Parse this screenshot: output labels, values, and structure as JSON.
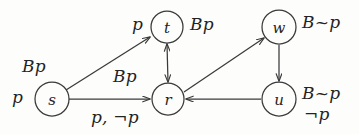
{
  "figure": {
    "type": "kripke-model-diagram",
    "ink_color": "#3a3a3a",
    "background_color": "#fdfdfc"
  },
  "nodes": [
    {
      "id": "s",
      "label": "s",
      "cx": 52,
      "cy": 99,
      "r": 17
    },
    {
      "id": "t",
      "label": "t",
      "cx": 167,
      "cy": 27,
      "r": 16
    },
    {
      "id": "r",
      "label": "r",
      "cx": 168,
      "cy": 99,
      "r": 16
    },
    {
      "id": "w",
      "label": "w",
      "cx": 279,
      "cy": 27,
      "r": 17
    },
    {
      "id": "u",
      "label": "u",
      "cx": 279,
      "cy": 99,
      "r": 17
    }
  ],
  "annotations": [
    {
      "for": "s",
      "text": "Bp",
      "position": "above-left",
      "x": 22,
      "y": 56
    },
    {
      "for": "s",
      "text": "p",
      "position": "left",
      "x": 12,
      "y": 87
    },
    {
      "for": "t",
      "text": "p",
      "position": "left",
      "x": 132,
      "y": 14
    },
    {
      "for": "t",
      "text": "Bp",
      "position": "right",
      "x": 190,
      "y": 14
    },
    {
      "for": "w",
      "text": "B~p",
      "position": "right",
      "x": 302,
      "y": 12
    },
    {
      "for": "u",
      "text": "B~p",
      "position": "right",
      "x": 302,
      "y": 83
    },
    {
      "for": "u",
      "text": "¬p",
      "position": "right-below",
      "x": 304,
      "y": 104
    },
    {
      "for": "r",
      "text": "Bp",
      "position": "above-left",
      "x": 113,
      "y": 66
    },
    {
      "for": "r",
      "text": "p, ¬p",
      "position": "below-left",
      "x": 91,
      "y": 107
    }
  ],
  "edges": [
    {
      "id": "s-t",
      "from": "s",
      "to": "t",
      "arrows": "single",
      "label": "Bp"
    },
    {
      "id": "s-r",
      "from": "s",
      "to": "r",
      "arrows": "single",
      "label": "p, ¬p"
    },
    {
      "id": "t-r",
      "from": "t",
      "to": "r",
      "arrows": "double",
      "label": ""
    },
    {
      "id": "r-w",
      "from": "r",
      "to": "w",
      "arrows": "single",
      "label": ""
    },
    {
      "id": "w-u",
      "from": "w",
      "to": "u",
      "arrows": "single",
      "label": ""
    },
    {
      "id": "u-r",
      "from": "u",
      "to": "r",
      "arrows": "single",
      "label": ""
    }
  ]
}
